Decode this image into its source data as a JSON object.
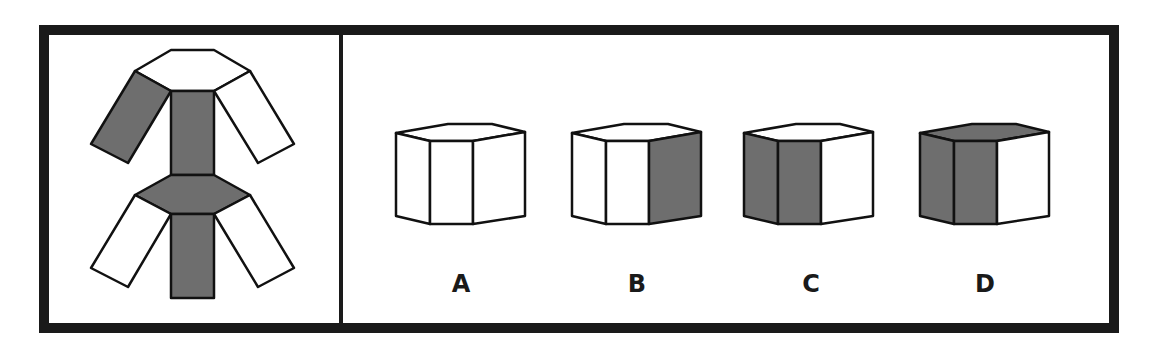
{
  "question_panel": {
    "description": "unfolded net of a hexagonal prism",
    "shaded_color": "#6e6e6e",
    "faces": [
      {
        "name": "top-hexagon",
        "shaded": false
      },
      {
        "name": "upper-left-side",
        "shaded": true
      },
      {
        "name": "upper-center-side",
        "shaded": true
      },
      {
        "name": "upper-right-side",
        "shaded": false
      },
      {
        "name": "bottom-hexagon",
        "shaded": true
      },
      {
        "name": "lower-left-side",
        "shaded": false
      },
      {
        "name": "lower-center-side",
        "shaded": true
      },
      {
        "name": "lower-right-side",
        "shaded": false
      }
    ]
  },
  "options": [
    {
      "label": "A",
      "top_shaded": false,
      "left_shaded": false,
      "front_shaded": false,
      "right_shaded": false
    },
    {
      "label": "B",
      "top_shaded": false,
      "left_shaded": false,
      "front_shaded": false,
      "right_shaded": true
    },
    {
      "label": "C",
      "top_shaded": false,
      "left_shaded": true,
      "front_shaded": true,
      "right_shaded": false
    },
    {
      "label": "D",
      "top_shaded": true,
      "left_shaded": true,
      "front_shaded": true,
      "right_shaded": false
    }
  ]
}
